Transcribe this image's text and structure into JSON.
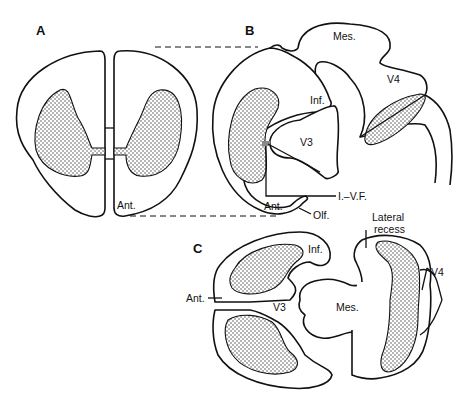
{
  "figure": {
    "panels": [
      {
        "id": "A",
        "label": "A",
        "labels": {
          "ant": "Ant."
        }
      },
      {
        "id": "B",
        "label": "B",
        "labels": {
          "mes": "Mes.",
          "v4": "V4",
          "inf": "Inf.",
          "v3": "V3",
          "ivf": "I.–V.F.",
          "ant": "Ant.",
          "olf": "Olf."
        }
      },
      {
        "id": "C",
        "label": "C",
        "labels": {
          "lateral_recess_1": "Lateral",
          "lateral_recess_2": "recess",
          "inf": "Inf.",
          "v4": "V4",
          "ant": "Ant.",
          "v3": "V3",
          "mes": "Mes."
        }
      }
    ],
    "colors": {
      "stroke": "#111111",
      "background": "#ffffff",
      "stipple": "#333333"
    }
  }
}
